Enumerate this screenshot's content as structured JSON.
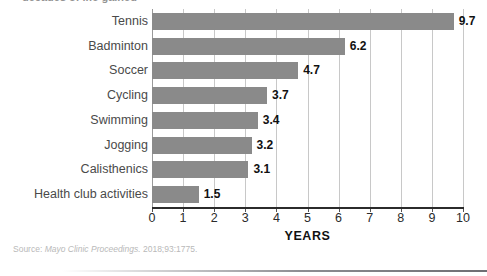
{
  "figure": {
    "clipped_title": "decades of life gained",
    "source_label": "Source:",
    "source_journal": "Mayo Clinic Proceedings.",
    "source_citation": "2018;93:1775."
  },
  "chart_data": {
    "type": "bar",
    "orientation": "horizontal",
    "title": "",
    "xlabel": "YEARS",
    "ylabel": "",
    "xlim": [
      0,
      10
    ],
    "xticks": [
      "0",
      "1",
      "2",
      "3",
      "4",
      "5",
      "6",
      "7",
      "8",
      "9",
      "10"
    ],
    "grid": true,
    "legend": false,
    "bar_color": "#8a8a8a",
    "gridline_color": "#c8c8c8",
    "categories": [
      "Tennis",
      "Badminton",
      "Soccer",
      "Cycling",
      "Swimming",
      "Jogging",
      "Calisthenics",
      "Health club activities"
    ],
    "values": [
      9.7,
      6.2,
      4.7,
      3.7,
      3.4,
      3.2,
      3.1,
      1.5
    ],
    "value_labels": [
      "9.7",
      "6.2",
      "4.7",
      "3.7",
      "3.4",
      "3.2",
      "3.1",
      "1.5"
    ]
  }
}
